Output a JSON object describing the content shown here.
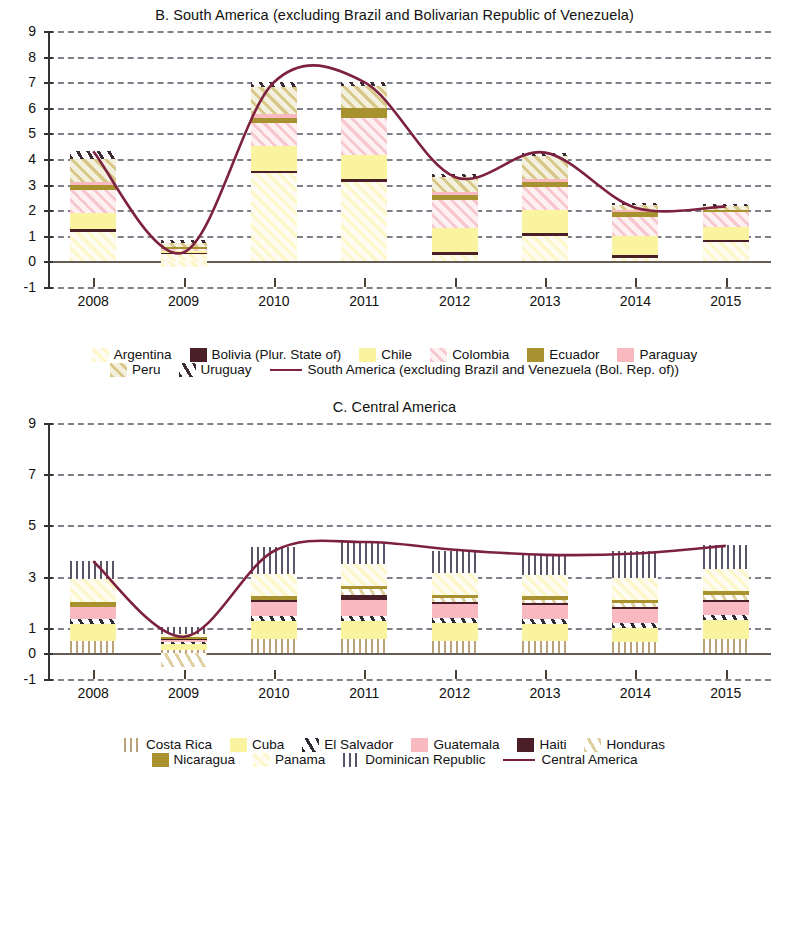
{
  "chart_data": [
    {
      "type": "bar",
      "title": "B. South America (excluding Brazil and Bolivarian Republic of Venezuela)",
      "panel_id": "B",
      "xlabel": "",
      "ylabel": "",
      "categories": [
        "2008",
        "2009",
        "2010",
        "2011",
        "2012",
        "2013",
        "2014",
        "2015"
      ],
      "ylim": [
        -1,
        9
      ],
      "yticks": [
        -1,
        0,
        1,
        2,
        3,
        4,
        5,
        6,
        7,
        8,
        9
      ],
      "ytick_labels": [
        "-1",
        "0",
        "1",
        "2",
        "3",
        "4",
        "5",
        "6",
        "7",
        "8",
        "9"
      ],
      "grid": true,
      "legend_position": "below",
      "stacked": true,
      "series": [
        {
          "name": "Argentina",
          "color": "#fdf6c8",
          "pattern": "diagonal-hatch",
          "values": [
            1.15,
            0.3,
            3.45,
            3.1,
            0.25,
            1.0,
            0.15,
            0.75
          ]
        },
        {
          "name": "Bolivia (Plur. State of)",
          "color": "#4b1f28",
          "pattern": "solid",
          "values": [
            0.1,
            0.05,
            0.1,
            0.1,
            0.1,
            0.1,
            0.1,
            0.1
          ]
        },
        {
          "name": "Chile",
          "color": "#faf4a0",
          "pattern": "solid",
          "values": [
            0.65,
            0.05,
            0.95,
            0.95,
            0.95,
            0.9,
            0.75,
            0.5
          ]
        },
        {
          "name": "Colombia",
          "color": "#f7c9cf",
          "pattern": "diagonal-hatch",
          "values": [
            0.9,
            0.1,
            0.9,
            1.45,
            1.1,
            0.9,
            0.75,
            0.6
          ]
        },
        {
          "name": "Ecuador",
          "color": "#a8922f",
          "pattern": "solid",
          "values": [
            0.2,
            0.05,
            0.2,
            0.4,
            0.2,
            0.2,
            0.2,
            0.05
          ]
        },
        {
          "name": "Paraguay",
          "color": "#f9b9c0",
          "pattern": "solid",
          "values": [
            0.1,
            0.0,
            0.15,
            0.0,
            0.1,
            0.1,
            0.05,
            0.0
          ]
        },
        {
          "name": "Peru",
          "color": "#d8c98a",
          "pattern": "diagonal-hatch",
          "values": [
            0.9,
            0.15,
            1.05,
            0.85,
            0.6,
            0.9,
            0.25,
            0.2
          ]
        },
        {
          "name": "Uruguay",
          "color": "#3b2b33",
          "pattern": "steep-hatch",
          "values": [
            0.3,
            0.15,
            0.2,
            0.15,
            0.1,
            0.15,
            0.05,
            0.05
          ]
        }
      ],
      "negative_series": [
        {
          "name": "Argentina",
          "year": "2009",
          "value": -0.2
        }
      ],
      "line": {
        "name": "South America (excluding Brazil and Venezuela (Bol. Rep. of))",
        "color": "#7d2140",
        "values": [
          4.3,
          0.35,
          7.0,
          7.0,
          3.3,
          4.25,
          2.1,
          2.15
        ],
        "peak_between_2010_2011": 7.6
      }
    },
    {
      "type": "bar",
      "title": "C.  Central America",
      "panel_id": "C",
      "xlabel": "",
      "ylabel": "",
      "categories": [
        "2008",
        "2009",
        "2010",
        "2011",
        "2012",
        "2013",
        "2014",
        "2015"
      ],
      "ylim": [
        -1,
        9
      ],
      "yticks": [
        -1,
        0,
        1,
        3,
        5,
        7,
        9
      ],
      "ytick_labels": [
        "-1",
        "0",
        "1",
        "3",
        "5",
        "7",
        "9"
      ],
      "grid": true,
      "legend_position": "below",
      "stacked": true,
      "series": [
        {
          "name": "Costa Rica",
          "color": "#b9a27a",
          "pattern": "vertical-lines",
          "values": [
            0.5,
            0.15,
            0.55,
            0.55,
            0.5,
            0.5,
            0.45,
            0.55
          ]
        },
        {
          "name": "Cuba",
          "color": "#faf4a0",
          "pattern": "solid",
          "values": [
            0.65,
            0.25,
            0.7,
            0.7,
            0.7,
            0.65,
            0.55,
            0.75
          ]
        },
        {
          "name": "El Salvador",
          "color": "#2e2a33",
          "pattern": "steep-hatch",
          "values": [
            0.2,
            0.05,
            0.2,
            0.2,
            0.2,
            0.2,
            0.2,
            0.2
          ]
        },
        {
          "name": "Guatemala",
          "color": "#f9b9c0",
          "pattern": "solid",
          "values": [
            0.45,
            0.1,
            0.55,
            0.65,
            0.55,
            0.55,
            0.55,
            0.55
          ]
        },
        {
          "name": "Haiti",
          "color": "#4b1f28",
          "pattern": "solid",
          "values": [
            0.0,
            0.05,
            0.1,
            0.2,
            0.05,
            0.05,
            0.05,
            0.05
          ]
        },
        {
          "name": "Honduras",
          "color": "#ded0a0",
          "pattern": "steep-hatch",
          "values": [
            0.0,
            0.0,
            0.0,
            0.2,
            0.15,
            0.15,
            0.15,
            0.2
          ]
        },
        {
          "name": "Nicaragua",
          "color": "#a8922f",
          "pattern": "solid",
          "values": [
            0.2,
            0.05,
            0.15,
            0.15,
            0.15,
            0.15,
            0.15,
            0.15
          ]
        },
        {
          "name": "Panama",
          "color": "#fdf6c8",
          "pattern": "diagonal-hatch",
          "values": [
            0.9,
            0.1,
            0.85,
            0.85,
            0.85,
            0.8,
            0.85,
            0.85
          ]
        },
        {
          "name": "Dominican Republic",
          "color": "#5a5566",
          "pattern": "vertical-lines",
          "values": [
            0.7,
            0.3,
            1.05,
            0.85,
            0.85,
            0.8,
            1.05,
            0.95
          ]
        }
      ],
      "negative_series": [
        {
          "name": "Honduras",
          "year": "2009",
          "value": -0.55
        }
      ],
      "line": {
        "name": "Central America",
        "color": "#7d2140",
        "values": [
          3.6,
          0.65,
          4.0,
          4.35,
          4.05,
          3.85,
          3.9,
          4.2
        ],
        "peak_between_2010_2011": 4.4
      }
    }
  ],
  "panelB": {
    "title": "B. South America (excluding Brazil and Bolivarian Republic of Venezuela)",
    "ytick_labels": [
      "9",
      "8",
      "7",
      "6",
      "5",
      "4",
      "3",
      "2",
      "1",
      "0",
      "-1"
    ],
    "xtick_labels": [
      "2008",
      "2009",
      "2010",
      "2011",
      "2012",
      "2013",
      "2014",
      "2015"
    ],
    "legend": [
      {
        "label": "Argentina",
        "swatch": "argentina"
      },
      {
        "label": "Bolivia (Plur. State of)",
        "swatch": "bolivia"
      },
      {
        "label": "Chile",
        "swatch": "chile"
      },
      {
        "label": "Colombia",
        "swatch": "colombia"
      },
      {
        "label": "Ecuador",
        "swatch": "ecuador"
      },
      {
        "label": "Paraguay",
        "swatch": "paraguay"
      },
      {
        "label": "Peru",
        "swatch": "peru"
      },
      {
        "label": "Uruguay",
        "swatch": "uruguay"
      }
    ],
    "line_legend": "South America (excluding Brazil and Venezuela (Bol. Rep. of))"
  },
  "panelC": {
    "title": "C.  Central America",
    "ytick_labels": [
      "9",
      "7",
      "5",
      "3",
      "1",
      "0",
      "-1"
    ],
    "xtick_labels": [
      "2008",
      "2009",
      "2010",
      "2011",
      "2012",
      "2013",
      "2014",
      "2015"
    ],
    "legend": [
      {
        "label": "Costa Rica",
        "swatch": "costarica"
      },
      {
        "label": "Cuba",
        "swatch": "cuba"
      },
      {
        "label": "El Salvador",
        "swatch": "elsalvador"
      },
      {
        "label": "Guatemala",
        "swatch": "guatemala"
      },
      {
        "label": "Haiti",
        "swatch": "haiti"
      },
      {
        "label": "Honduras",
        "swatch": "honduras"
      },
      {
        "label": "Nicaragua",
        "swatch": "nicaragua"
      },
      {
        "label": "Panama",
        "swatch": "panama"
      },
      {
        "label": "Dominican Republic",
        "swatch": "dominican"
      }
    ],
    "line_legend": "Central America"
  },
  "colors": {
    "line": "#7d2140",
    "grid": "#6b6b78",
    "axis": "#333333",
    "zero": "#4a4036"
  }
}
